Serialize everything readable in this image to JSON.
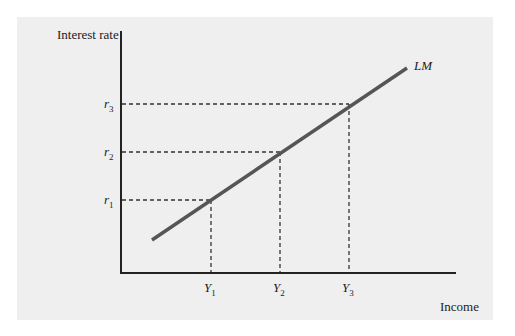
{
  "figure": {
    "y_axis_label": "Interest rate",
    "x_axis_label": "Income",
    "curve_label": "LM",
    "y_ticks": [
      {
        "base": "r",
        "sub": "1"
      },
      {
        "base": "r",
        "sub": "2"
      },
      {
        "base": "r",
        "sub": "3"
      }
    ],
    "x_ticks": [
      {
        "base": "Y",
        "sub": "1"
      },
      {
        "base": "Y",
        "sub": "2"
      },
      {
        "base": "Y",
        "sub": "3"
      }
    ],
    "colors": {
      "panel": "#efefef",
      "axis": "#222222",
      "curve": "#555555",
      "guide": "#333333"
    }
  }
}
